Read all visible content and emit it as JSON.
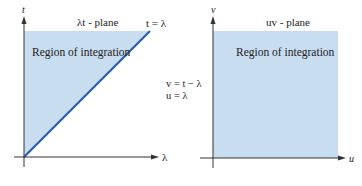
{
  "colors": {
    "region_fill": "#c9ddf0",
    "boundary_line": "#2b5cab",
    "axis": "#333333",
    "text": "#222222"
  },
  "left_plane": {
    "title": "λt - plane",
    "vertical_axis_label": "t",
    "horizontal_axis_label": "λ",
    "region_label": "Region of integration",
    "boundary_label": "t = λ",
    "region_shape": "triangle between t-axis, top edge, and line t = λ"
  },
  "transform": {
    "line1": "v = t − λ",
    "line2": "u = λ"
  },
  "right_plane": {
    "title": "uv - plane",
    "vertical_axis_label": "v",
    "horizontal_axis_label": "u",
    "region_label": "Region of integration",
    "region_shape": "rectangle (first quadrant)"
  }
}
